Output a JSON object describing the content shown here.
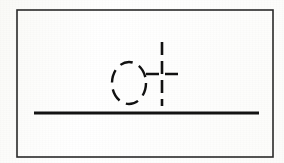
{
  "canvas": {
    "width": 284,
    "height": 163,
    "background_color": "#ffffff",
    "ink_color": "#1a1a1a",
    "description": "Scanned technical line drawing"
  },
  "frame": {
    "name": "drawing-border",
    "x": 17,
    "y": 10,
    "width": 256,
    "height": 147,
    "stroke_width": 1.6,
    "stroke_color": "#2a2a2a",
    "style": "solid"
  },
  "shapes": {
    "dashed_circle": {
      "label": "dashed center circle",
      "cx": 129,
      "cy": 83,
      "rx": 17,
      "ry": 21,
      "stroke_width": 2.4,
      "stroke_color": "#121212",
      "style": "dashed",
      "dash_pattern": "13 7"
    },
    "crosshair": {
      "label": "dashed center mark crosshair",
      "cx": 162,
      "cy": 74,
      "vertical": {
        "x": 162,
        "y1": 42,
        "y2": 106,
        "stroke_width": 2.6,
        "dash_pattern": "13 6"
      },
      "horizontal": {
        "y": 74,
        "x1": 146,
        "x2": 179,
        "stroke_width": 2.6,
        "dash_pattern": "13 6"
      },
      "stroke_color": "#121212",
      "style": "dashed"
    },
    "baseline": {
      "label": "solid horizontal line",
      "x1": 34,
      "x2": 259,
      "y": 113,
      "stroke_width": 2.8,
      "stroke_color": "#141414",
      "style": "solid"
    }
  }
}
